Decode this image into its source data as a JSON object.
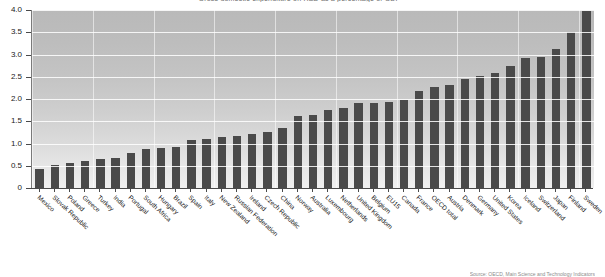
{
  "chart_data": {
    "type": "bar",
    "title": "Gross domestic expenditure on R&D as a percentage of GDP",
    "xlabel": "",
    "ylabel": "",
    "ylim": [
      0,
      4.0
    ],
    "ytick_labels": [
      "0",
      "0.5",
      "1.0",
      "1.5",
      "2.0",
      "2.5",
      "3.0",
      "3.5",
      "4.0"
    ],
    "ytick_values": [
      0,
      0.5,
      1.0,
      1.5,
      2.0,
      2.5,
      3.0,
      3.5,
      4.0
    ],
    "grid": true,
    "legend": "none",
    "bar_color": "#4a4a4a",
    "plot_background": "#c8c8c8",
    "categories": [
      "Mexico",
      "Slovak Republic",
      "Poland",
      "Greece",
      "Turkey",
      "India",
      "Portugal",
      "South Africa",
      "Hungary",
      "Brazil",
      "Spain",
      "Italy",
      "New Zealand",
      "Russian Federation",
      "Ireland",
      "Czech Republic",
      "China",
      "Norway",
      "Australia",
      "Luxembourg",
      "Netherlands",
      "United Kingdom",
      "Belgium",
      "EU15",
      "Canada",
      "France",
      "OECD total",
      "Austria",
      "Denmark",
      "Germany",
      "United States",
      "Korea",
      "Iceland",
      "Switzerland",
      "Japan",
      "Finland",
      "Sweden"
    ],
    "values": [
      0.43,
      0.52,
      0.57,
      0.6,
      0.65,
      0.68,
      0.78,
      0.87,
      0.9,
      0.92,
      1.07,
      1.11,
      1.15,
      1.17,
      1.21,
      1.27,
      1.35,
      1.62,
      1.65,
      1.76,
      1.79,
      1.9,
      1.92,
      1.93,
      1.98,
      2.18,
      2.26,
      2.31,
      2.44,
      2.52,
      2.59,
      2.74,
      2.93,
      2.94,
      3.13,
      3.51,
      3.98
    ],
    "source_note": "Source: OECD, Main Science and Technology Indicators"
  }
}
